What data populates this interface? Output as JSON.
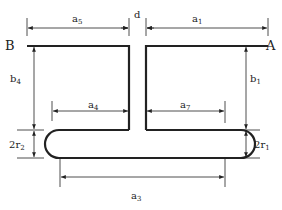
{
  "diagram": {
    "points": {
      "left_end": "B",
      "right_end": "A"
    },
    "dimensions": {
      "a5": {
        "base": "a",
        "sub": "5"
      },
      "d": {
        "base": "d",
        "sub": ""
      },
      "a1": {
        "base": "a",
        "sub": "1"
      },
      "b4": {
        "base": "b",
        "sub": "4"
      },
      "b1": {
        "base": "b",
        "sub": "1"
      },
      "a4": {
        "base": "a",
        "sub": "4"
      },
      "a7": {
        "base": "a",
        "sub": "7"
      },
      "r2": {
        "prefix": "2",
        "base": "r",
        "sub": "2"
      },
      "r1": {
        "prefix": "2",
        "base": "r",
        "sub": "1"
      },
      "a3": {
        "base": "a",
        "sub": "3"
      }
    },
    "colors": {
      "stroke": "#222222",
      "background": "#ffffff"
    }
  }
}
